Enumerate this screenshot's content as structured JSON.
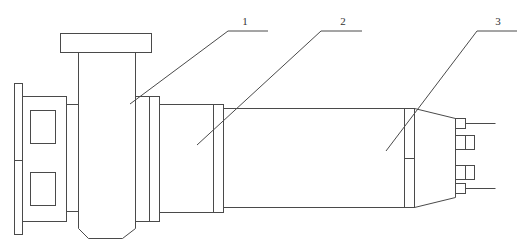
{
  "diagram": {
    "type": "mechanical-schematic",
    "stroke_color": "#4a4a4a",
    "background": "#ffffff",
    "callouts": [
      {
        "id": "1",
        "label": "1",
        "target": "pump-casing"
      },
      {
        "id": "2",
        "label": "2",
        "target": "intermediate-housing"
      },
      {
        "id": "3",
        "label": "3",
        "target": "motor-body"
      }
    ]
  }
}
